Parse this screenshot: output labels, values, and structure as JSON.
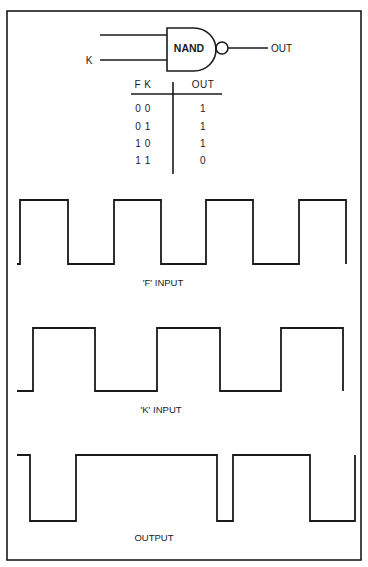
{
  "gate": {
    "type_label": "NAND",
    "input_top_label": "",
    "input_bottom_label": "K",
    "output_label": "OUT"
  },
  "truth_table": {
    "headers": {
      "inputs": "F K",
      "output": "OUT"
    },
    "rows": [
      {
        "inputs": "0 0",
        "output": "1"
      },
      {
        "inputs": "0 1",
        "output": "1"
      },
      {
        "inputs": "1 0",
        "output": "1"
      },
      {
        "inputs": "1 1",
        "output": "0"
      }
    ]
  },
  "waveforms": [
    {
      "name": "f-input",
      "label": "'F' INPUT",
      "high_y": 200,
      "low_y": 264,
      "points": [
        [
          17,
          264
        ],
        [
          20,
          264
        ],
        [
          20,
          200
        ],
        [
          68,
          200
        ],
        [
          68,
          264
        ],
        [
          114,
          264
        ],
        [
          114,
          200
        ],
        [
          161,
          200
        ],
        [
          161,
          264
        ],
        [
          206,
          264
        ],
        [
          206,
          200
        ],
        [
          253,
          200
        ],
        [
          253,
          264
        ],
        [
          299,
          264
        ],
        [
          299,
          200
        ],
        [
          346,
          200
        ],
        [
          346,
          264
        ]
      ]
    },
    {
      "name": "k-input",
      "label": "'K' INPUT",
      "high_y": 328,
      "low_y": 391,
      "points": [
        [
          17,
          391
        ],
        [
          33,
          391
        ],
        [
          33,
          328
        ],
        [
          95,
          328
        ],
        [
          95,
          391
        ],
        [
          157,
          391
        ],
        [
          157,
          328
        ],
        [
          220,
          328
        ],
        [
          220,
          391
        ],
        [
          281,
          391
        ],
        [
          281,
          328
        ],
        [
          343,
          328
        ],
        [
          343,
          391
        ]
      ]
    },
    {
      "name": "output",
      "label": "OUTPUT",
      "high_y": 455,
      "low_y": 521,
      "points": [
        [
          17,
          455
        ],
        [
          30,
          455
        ],
        [
          30,
          521
        ],
        [
          76,
          521
        ],
        [
          76,
          455
        ],
        [
          217,
          455
        ],
        [
          217,
          521
        ],
        [
          233,
          521
        ],
        [
          233,
          455
        ],
        [
          310,
          455
        ],
        [
          310,
          521
        ],
        [
          355,
          521
        ],
        [
          355,
          455
        ]
      ]
    }
  ],
  "colors": {
    "ink": "#1a1a1a",
    "paper": "#ffffff"
  }
}
